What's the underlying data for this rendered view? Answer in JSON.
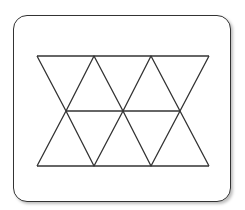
{
  "diagram": {
    "type": "triangle-grid",
    "stroke_color": "#333333",
    "frame_color": "#333333",
    "rows": 2,
    "top_vertices": [
      [
        37,
        56
      ],
      [
        94,
        56
      ],
      [
        151,
        56
      ],
      [
        209,
        56
      ]
    ],
    "middle_vertices": [
      [
        66,
        111
      ],
      [
        123,
        111
      ],
      [
        180,
        111
      ]
    ],
    "bottom_vertices": [
      [
        37,
        166
      ],
      [
        94,
        166
      ],
      [
        151,
        166
      ],
      [
        209,
        166
      ]
    ]
  }
}
